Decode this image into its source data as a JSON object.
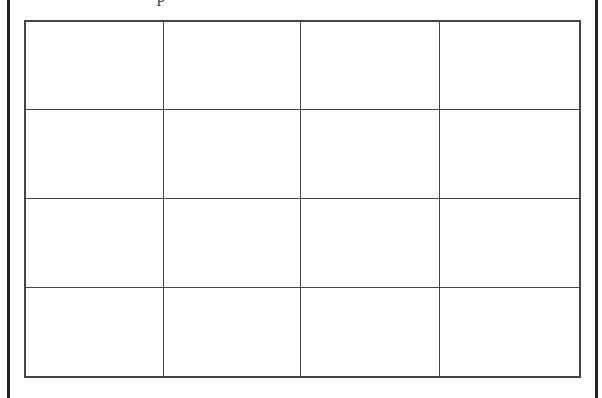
{
  "page": {
    "cutoff_text": "p",
    "border_color": "#222222",
    "line_color": "#444444"
  },
  "table": {
    "rows": 4,
    "columns": 4,
    "column_widths": [
      139,
      138,
      140,
      140
    ],
    "row_heights": [
      89,
      90,
      90,
      89
    ],
    "cells": [
      [
        "",
        "",
        "",
        ""
      ],
      [
        "",
        "",
        "",
        ""
      ],
      [
        "",
        "",
        "",
        ""
      ],
      [
        "",
        "",
        "",
        ""
      ]
    ]
  }
}
